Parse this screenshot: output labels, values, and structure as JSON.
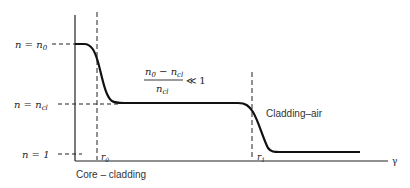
{
  "diagram": {
    "type": "refractive-index-profile",
    "axes": {
      "x_label": "γ",
      "y_levels": [
        {
          "id": "n0",
          "label": "n = n₀"
        },
        {
          "id": "ncl",
          "label": "n = n cl"
        },
        {
          "id": "one",
          "label": "n = 1"
        }
      ]
    },
    "labels": {
      "y_n0_prefix": "n = n",
      "y_n0_sub": "0",
      "y_ncl_prefix": "n = n",
      "y_ncl_sub": "cl",
      "y_one": "n = 1",
      "r0_prefix": "r",
      "r0_sub": "0",
      "r1_prefix": "r",
      "r1_sub": "1",
      "x_axis": "γ",
      "core_cladding": "Core – cladding",
      "cladding_air": "Cladding–air",
      "fraction_num_a": "n",
      "fraction_num_a_sub": "0",
      "fraction_minus": " − n",
      "fraction_num_b_sub": "cl",
      "fraction_den": "n",
      "fraction_den_sub": "cl",
      "fraction_relation": "≪ 1"
    },
    "colors": {
      "curve": "#111111",
      "axis": "#222222",
      "text": "#222222"
    }
  }
}
